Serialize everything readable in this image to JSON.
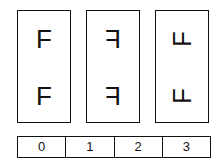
{
  "panels": [
    {
      "glyph": "F",
      "transform": "normal"
    },
    {
      "glyph": "F",
      "transform": "mirrored-horizontal"
    },
    {
      "glyph": "F",
      "transform": "rotated"
    }
  ],
  "index_bar": {
    "cells": [
      "0",
      "1",
      "2",
      "3"
    ]
  }
}
